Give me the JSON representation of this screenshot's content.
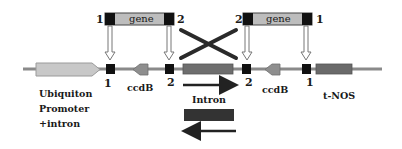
{
  "diagram": {
    "title": "",
    "colors": {
      "backbone": "#8a8a8a",
      "promoter": "#c8c8c8",
      "gene_fill": "#bdbdbd",
      "att_site": "#111111",
      "ccdB": "#8e8e8e",
      "intron": "#6e6e6e",
      "tNOS": "#6a6a6a",
      "cross_lines": "#2a2a2a"
    },
    "donor_fragments": [
      {
        "label": "gene",
        "left_site": "1",
        "right_site": "2"
      },
      {
        "label": "gene",
        "left_site": "2",
        "right_site": "1"
      }
    ],
    "vector_elements": [
      {
        "id": "promoter",
        "label_lines": [
          "Ubiquiton",
          "Promoter",
          "+intron"
        ]
      },
      {
        "id": "site-1-left",
        "label": "1"
      },
      {
        "id": "ccdB-left",
        "label": "ccdB"
      },
      {
        "id": "site-2-left",
        "label": "2"
      },
      {
        "id": "intron",
        "label": "Intron"
      },
      {
        "id": "site-2-right",
        "label": "2"
      },
      {
        "id": "ccdB-right",
        "label": "ccdB"
      },
      {
        "id": "site-1-right",
        "label": "1"
      },
      {
        "id": "terminator",
        "label": "t-NOS"
      }
    ],
    "legend": {
      "intron_label": "Intron",
      "forward_arrow": "forward orientation",
      "reverse_arrow": "reverse orientation"
    }
  }
}
